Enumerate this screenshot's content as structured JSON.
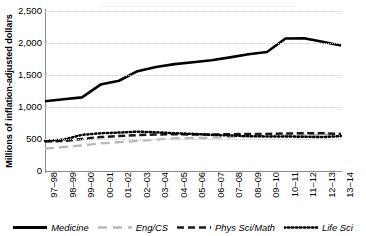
{
  "chart_data": {
    "type": "line",
    "title": "",
    "xlabel": "",
    "ylabel": "Millions of inflation-adjusted dollars",
    "ylim": [
      0,
      2500
    ],
    "yticks": [
      0,
      500,
      1000,
      1500,
      2000,
      2500
    ],
    "ytick_labels": [
      "0",
      "500",
      "1,000",
      "1,500",
      "2,000",
      "2,500"
    ],
    "grid": true,
    "legend_position": "bottom",
    "categories": [
      "97–98",
      "98–99",
      "99–00",
      "00–01",
      "01–02",
      "02–03",
      "03–04",
      "04–05",
      "05–06",
      "06–07",
      "07–08",
      "08–09",
      "09–10",
      "10–11",
      "11–12",
      "12–13",
      "13–14"
    ],
    "series": [
      {
        "name": "Medicine",
        "style": "solid",
        "color": "#000000",
        "width": 2.6,
        "values": [
          1090,
          1120,
          1150,
          1350,
          1410,
          1560,
          1625,
          1670,
          1700,
          1730,
          1775,
          1825,
          1860,
          2070,
          2075,
          2020,
          1960
        ]
      },
      {
        "name": "Eng/CS",
        "style": "dashed-light",
        "color": "#b8b8b8",
        "width": 2.3,
        "values": [
          350,
          375,
          400,
          430,
          450,
          470,
          490,
          510,
          515,
          520,
          530,
          540,
          545,
          555,
          560,
          565,
          575
        ]
      },
      {
        "name": "Phys Sci/Math",
        "style": "dashed",
        "color": "#1a1a1a",
        "width": 2.5,
        "values": [
          460,
          470,
          500,
          530,
          545,
          560,
          570,
          575,
          570,
          570,
          575,
          580,
          580,
          585,
          590,
          590,
          580
        ]
      },
      {
        "name": "Life Sci",
        "style": "dotted",
        "color": "#000000",
        "width": 2.5,
        "values": [
          470,
          490,
          565,
          590,
          600,
          615,
          605,
          590,
          580,
          565,
          555,
          545,
          540,
          540,
          535,
          530,
          545
        ]
      }
    ]
  },
  "legend": {
    "items": [
      {
        "label": "Medicine",
        "swatch": "solid-black-line"
      },
      {
        "label": "Eng/CS",
        "swatch": "dashed-gray-line"
      },
      {
        "label": "Phys Sci/Math",
        "swatch": "dashed-black-line"
      },
      {
        "label": "Life Sci",
        "swatch": "dotted-black-line"
      }
    ]
  }
}
